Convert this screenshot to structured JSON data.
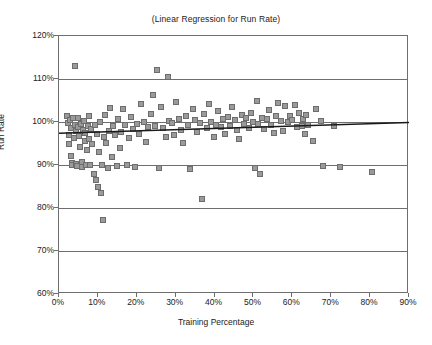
{
  "chart_data": {
    "type": "scatter",
    "title": "(Linear Regression for Run Rate)",
    "xlabel": "Training Percentage",
    "ylabel": "Run Rate",
    "xlim": [
      0,
      90
    ],
    "ylim": [
      60,
      120
    ],
    "x_ticks": [
      "0%",
      "10%",
      "20%",
      "30%",
      "40%",
      "50%",
      "60%",
      "70%",
      "80%",
      "90%"
    ],
    "x_tick_values": [
      0,
      10,
      20,
      30,
      40,
      50,
      60,
      70,
      80,
      90
    ],
    "y_ticks": [
      "60%",
      "70%",
      "80%",
      "90%",
      "100%",
      "110%",
      "120%"
    ],
    "y_tick_values": [
      60,
      70,
      80,
      90,
      100,
      110,
      120
    ],
    "grid": "horizontal",
    "legend": "none",
    "marker": {
      "shape": "square",
      "fill_color": "#9a9a9a",
      "edge_color": "#6d6d6d",
      "size_px": 6
    },
    "trendline": {
      "type": "linear",
      "color": "#1a1a1a",
      "x_start": 0,
      "y_start": 97.4,
      "x_end": 90,
      "y_end": 99.9
    },
    "points": [
      [
        2.0,
        101.5
      ],
      [
        2.2,
        99.8
      ],
      [
        2.5,
        97.0
      ],
      [
        2.6,
        95.0
      ],
      [
        2.8,
        100.4
      ],
      [
        3.0,
        98.6
      ],
      [
        3.1,
        92.0
      ],
      [
        3.3,
        90.4
      ],
      [
        3.4,
        89.9
      ],
      [
        3.6,
        100.9
      ],
      [
        3.8,
        96.3
      ],
      [
        4.0,
        113.0
      ],
      [
        4.1,
        99.3
      ],
      [
        4.3,
        97.8
      ],
      [
        4.4,
        90.2
      ],
      [
        4.6,
        89.7
      ],
      [
        4.8,
        101.0
      ],
      [
        5.0,
        98.9
      ],
      [
        5.2,
        96.8
      ],
      [
        5.4,
        94.2
      ],
      [
        5.6,
        99.6
      ],
      [
        5.8,
        90.6
      ],
      [
        6.0,
        89.6
      ],
      [
        6.2,
        98.2
      ],
      [
        6.4,
        100.2
      ],
      [
        6.6,
        95.6
      ],
      [
        6.8,
        97.4
      ],
      [
        7.0,
        89.9
      ],
      [
        7.2,
        93.6
      ],
      [
        7.4,
        99.1
      ],
      [
        7.6,
        101.3
      ],
      [
        7.8,
        96.0
      ],
      [
        8.0,
        90.0
      ],
      [
        8.3,
        98.4
      ],
      [
        8.6,
        94.8
      ],
      [
        8.9,
        88.0
      ],
      [
        9.2,
        99.4
      ],
      [
        9.5,
        86.6
      ],
      [
        9.8,
        97.2
      ],
      [
        10.0,
        84.9
      ],
      [
        10.2,
        93.1
      ],
      [
        10.5,
        99.9
      ],
      [
        10.8,
        83.4
      ],
      [
        11.0,
        90.1
      ],
      [
        11.3,
        77.2
      ],
      [
        11.6,
        96.5
      ],
      [
        11.9,
        101.6
      ],
      [
        12.2,
        95.2
      ],
      [
        12.5,
        89.4
      ],
      [
        12.8,
        98.0
      ],
      [
        13.2,
        103.2
      ],
      [
        13.6,
        91.8
      ],
      [
        14.0,
        99.0
      ],
      [
        14.4,
        96.9
      ],
      [
        14.8,
        89.8
      ],
      [
        15.2,
        100.6
      ],
      [
        15.6,
        94.0
      ],
      [
        16.0,
        97.6
      ],
      [
        16.5,
        103.0
      ],
      [
        17.0,
        99.2
      ],
      [
        17.5,
        90.0
      ],
      [
        18.0,
        96.2
      ],
      [
        18.5,
        101.1
      ],
      [
        19.0,
        98.3
      ],
      [
        19.5,
        89.6
      ],
      [
        20.0,
        99.5
      ],
      [
        20.6,
        97.1
      ],
      [
        21.2,
        104.1
      ],
      [
        21.8,
        100.0
      ],
      [
        22.4,
        95.4
      ],
      [
        23.0,
        98.8
      ],
      [
        23.6,
        101.8
      ],
      [
        24.2,
        106.2
      ],
      [
        24.8,
        99.1
      ],
      [
        25.2,
        112.2
      ],
      [
        25.6,
        89.4
      ],
      [
        26.2,
        103.4
      ],
      [
        26.8,
        98.5
      ],
      [
        27.4,
        96.4
      ],
      [
        28.0,
        110.4
      ],
      [
        28.4,
        100.3
      ],
      [
        29.0,
        99.7
      ],
      [
        29.6,
        97.0
      ],
      [
        30.2,
        104.6
      ],
      [
        30.8,
        100.8
      ],
      [
        31.4,
        98.1
      ],
      [
        32.0,
        95.2
      ],
      [
        32.6,
        101.4
      ],
      [
        33.2,
        99.3
      ],
      [
        33.8,
        89.0
      ],
      [
        34.4,
        103.1
      ],
      [
        35.0,
        100.5
      ],
      [
        35.6,
        97.7
      ],
      [
        36.2,
        99.8
      ],
      [
        36.8,
        82.0
      ],
      [
        37.4,
        101.9
      ],
      [
        38.0,
        98.6
      ],
      [
        38.6,
        104.2
      ],
      [
        39.2,
        100.1
      ],
      [
        39.8,
        96.6
      ],
      [
        40.4,
        99.4
      ],
      [
        41.0,
        102.6
      ],
      [
        41.6,
        98.9
      ],
      [
        42.2,
        100.7
      ],
      [
        42.8,
        97.3
      ],
      [
        43.4,
        101.2
      ],
      [
        44.0,
        99.0
      ],
      [
        44.6,
        103.6
      ],
      [
        45.2,
        100.4
      ],
      [
        45.8,
        98.2
      ],
      [
        46.4,
        96.1
      ],
      [
        47.0,
        101.7
      ],
      [
        47.6,
        99.6
      ],
      [
        48.2,
        100.9
      ],
      [
        48.8,
        98.7
      ],
      [
        49.4,
        102.2
      ],
      [
        50.0,
        100.0
      ],
      [
        50.4,
        89.2
      ],
      [
        50.8,
        104.8
      ],
      [
        51.2,
        99.5
      ],
      [
        51.6,
        87.8
      ],
      [
        52.2,
        101.0
      ],
      [
        52.8,
        98.4
      ],
      [
        53.4,
        100.6
      ],
      [
        54.0,
        102.8
      ],
      [
        54.6,
        99.2
      ],
      [
        55.2,
        97.5
      ],
      [
        55.8,
        101.5
      ],
      [
        56.4,
        104.4
      ],
      [
        57.0,
        100.2
      ],
      [
        57.6,
        98.0
      ],
      [
        58.2,
        103.8
      ],
      [
        58.8,
        99.9
      ],
      [
        59.4,
        101.3
      ],
      [
        60.0,
        100.5
      ],
      [
        60.6,
        104.0
      ],
      [
        61.2,
        98.8
      ],
      [
        61.8,
        102.0
      ],
      [
        62.4,
        99.1
      ],
      [
        62.8,
        100.8
      ],
      [
        63.2,
        97.2
      ],
      [
        63.6,
        101.6
      ],
      [
        64.0,
        99.4
      ],
      [
        65.2,
        95.6
      ],
      [
        66.0,
        103.0
      ],
      [
        67.4,
        100.2
      ],
      [
        68.0,
        89.8
      ],
      [
        70.6,
        99.0
      ],
      [
        72.2,
        89.6
      ],
      [
        80.6,
        88.4
      ]
    ]
  }
}
